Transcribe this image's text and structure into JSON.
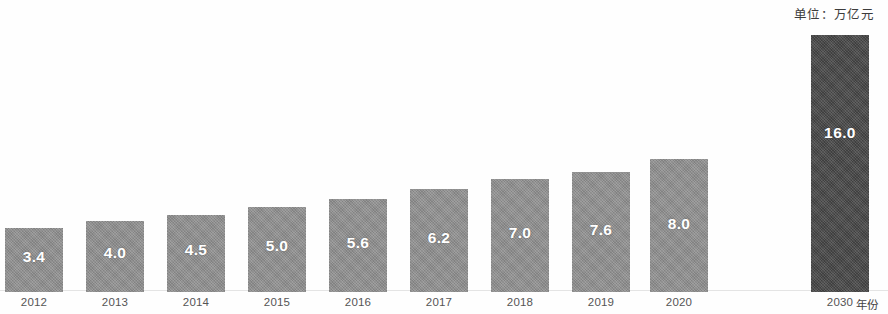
{
  "chart_data": {
    "type": "bar",
    "title": "",
    "subtitle": "",
    "unit_note": "单位：万亿元",
    "xlabel": "年份",
    "ylabel": "",
    "categories": [
      "2012",
      "2013",
      "2014",
      "2015",
      "2016",
      "2017",
      "2018",
      "2019",
      "2020",
      "2030"
    ],
    "values": [
      3.4,
      4.0,
      4.5,
      5.0,
      5.6,
      6.2,
      7.0,
      7.6,
      8.0,
      16.0
    ],
    "value_labels": [
      "3.4",
      "4.0",
      "4.5",
      "5.0",
      "5.6",
      "6.2",
      "7.0",
      "7.6",
      "8.0",
      "16.0"
    ],
    "ylim": [
      0,
      16.0
    ],
    "grid": false,
    "legend": null,
    "bar_colors": [
      "#8f8f8f",
      "#8f8f8f",
      "#8f8f8f",
      "#8f8f8f",
      "#8f8f8f",
      "#8f8f8f",
      "#8f8f8f",
      "#8f8f8f",
      "#8f8f8f",
      "#4b4b4b"
    ],
    "highlight_category": "2030",
    "highlight_color": "#4b4b4b",
    "base_color": "#8f8f8f",
    "value_label_color": "#ffffff"
  },
  "layout": {
    "bars": [
      {
        "category": "2012",
        "value_label": "3.4",
        "left": 5,
        "width": 58,
        "height": 64,
        "dark": false,
        "label_bottom": 26
      },
      {
        "category": "2013",
        "value_label": "4.0",
        "left": 86,
        "width": 58,
        "height": 71,
        "dark": false,
        "label_bottom": 30
      },
      {
        "category": "2014",
        "value_label": "4.5",
        "left": 167,
        "width": 58,
        "height": 77,
        "dark": false,
        "label_bottom": 33
      },
      {
        "category": "2015",
        "value_label": "5.0",
        "left": 248,
        "width": 58,
        "height": 85,
        "dark": false,
        "label_bottom": 37
      },
      {
        "category": "2016",
        "value_label": "5.6",
        "left": 329,
        "width": 58,
        "height": 93,
        "dark": false,
        "label_bottom": 40
      },
      {
        "category": "2017",
        "value_label": "6.2",
        "left": 410,
        "width": 58,
        "height": 103,
        "dark": false,
        "label_bottom": 45
      },
      {
        "category": "2018",
        "value_label": "7.0",
        "left": 491,
        "width": 58,
        "height": 113,
        "dark": false,
        "label_bottom": 50
      },
      {
        "category": "2019",
        "value_label": "7.6",
        "left": 572,
        "width": 58,
        "height": 120,
        "dark": false,
        "label_bottom": 53
      },
      {
        "category": "2020",
        "value_label": "8.0",
        "left": 650,
        "width": 58,
        "height": 133,
        "dark": false,
        "label_bottom": 59
      },
      {
        "category": "2030",
        "value_label": "16.0",
        "left": 811,
        "width": 58,
        "height": 257,
        "dark": true,
        "label_bottom": 150
      }
    ]
  }
}
